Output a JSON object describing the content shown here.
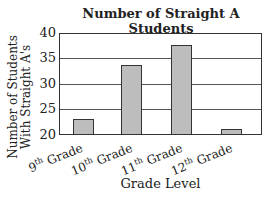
{
  "chart_data": {
    "type": "bar",
    "title": "Number of Straight A Students",
    "xlabel": "Grade Level",
    "ylabel": "Number of Students With Straight A's",
    "categories": [
      "9th Grade",
      "10th Grade",
      "11th Grade",
      "12th Grade"
    ],
    "category_parts": [
      [
        "9",
        "th",
        " Grade"
      ],
      [
        "10",
        "th",
        " Grade"
      ],
      [
        "11",
        "th",
        " Grade"
      ],
      [
        "12",
        "th",
        " Grade"
      ]
    ],
    "values": [
      23,
      34,
      38,
      21
    ],
    "ylim": [
      20,
      40
    ],
    "yticks": [
      "40",
      "35",
      "30",
      "25",
      "20"
    ],
    "grid": true,
    "bar_color": "#bdbdbd"
  }
}
